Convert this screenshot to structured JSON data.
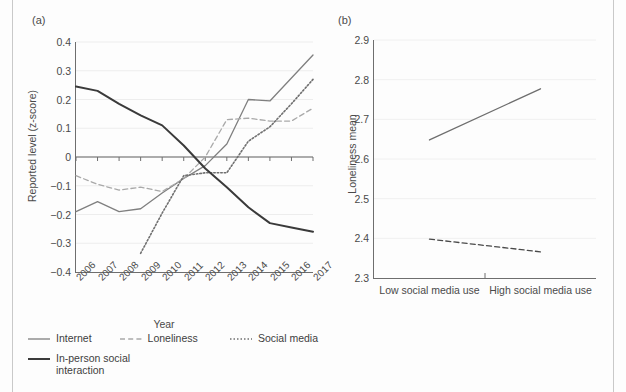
{
  "figure": {
    "background": "#fdfdfd",
    "rule_color": "#c9c9c9"
  },
  "panel_a": {
    "tag": "(a)",
    "xlabel": "Year",
    "ylabel": "Reported level (z-score)",
    "legend": [
      {
        "label": "Internet",
        "style": "solid",
        "color": "#7f7f7f"
      },
      {
        "label": "Loneliness",
        "style": "dashed",
        "color": "#a9a9a9"
      },
      {
        "label": "Social media",
        "style": "dotted",
        "color": "#707070"
      },
      {
        "label": "In-person social interaction",
        "style": "solid-bold",
        "color": "#3a3a3a"
      }
    ]
  },
  "panel_b": {
    "tag": "(b)",
    "ylabel": "Loneliness mean",
    "legend": [
      {
        "label": "Low in-person social interaction",
        "style": "solid",
        "color": "#6e6e6e"
      },
      {
        "label": "High in-person social interaction",
        "style": "dashed",
        "color": "#4a4a4a"
      }
    ]
  },
  "chart_data": [
    {
      "panel": "(a)",
      "type": "line",
      "title": "",
      "xlabel": "Year",
      "ylabel": "Reported level (z-score)",
      "x": [
        2006,
        2007,
        2008,
        2009,
        2010,
        2011,
        2012,
        2013,
        2014,
        2015,
        2016,
        2017
      ],
      "categories": [
        "2006",
        "2007",
        "2008",
        "2009",
        "2010",
        "2011",
        "2012",
        "2013",
        "2014",
        "2015",
        "2016",
        "2017"
      ],
      "xlim": [
        2006,
        2017
      ],
      "ylim": [
        -0.4,
        0.4
      ],
      "yticks": [
        -0.4,
        -0.3,
        -0.2,
        -0.1,
        0,
        0.1,
        0.2,
        0.3,
        0.4
      ],
      "ytick_labels": [
        "-0.4",
        "-0.3",
        "-0.2",
        "-0.1",
        "0",
        "0.1",
        "0.2",
        "0.3",
        "0.4"
      ],
      "grid": true,
      "legend_position": "bottom",
      "series": [
        {
          "name": "Internet",
          "style": "solid",
          "color": "#7f7f7f",
          "values": [
            -0.19,
            -0.155,
            -0.19,
            -0.18,
            -0.125,
            -0.075,
            -0.03,
            0.045,
            0.2,
            0.195,
            0.275,
            0.355
          ]
        },
        {
          "name": "Loneliness",
          "style": "dashed",
          "color": "#a9a9a9",
          "values": [
            -0.065,
            -0.095,
            -0.115,
            -0.105,
            -0.12,
            -0.075,
            0.0,
            0.13,
            0.135,
            0.125,
            0.125,
            0.17
          ]
        },
        {
          "name": "Social media",
          "style": "dotted",
          "color": "#707070",
          "values": [
            null,
            null,
            null,
            -0.335,
            -0.195,
            -0.065,
            -0.055,
            -0.055,
            0.055,
            0.105,
            0.185,
            0.27
          ]
        },
        {
          "name": "In-person social interaction",
          "style": "solid-bold",
          "color": "#3a3a3a",
          "values": [
            0.245,
            0.23,
            0.185,
            0.145,
            0.11,
            0.04,
            -0.04,
            -0.105,
            -0.175,
            -0.23,
            -0.245,
            -0.26
          ]
        }
      ]
    },
    {
      "panel": "(b)",
      "type": "line",
      "title": "",
      "xlabel": "",
      "ylabel": "Loneliness mean",
      "categories": [
        "Low social media use",
        "High social media use"
      ],
      "ylim": [
        2.3,
        2.9
      ],
      "yticks": [
        2.3,
        2.4,
        2.5,
        2.6,
        2.7,
        2.8,
        2.9
      ],
      "ytick_labels": [
        "2.3",
        "2.4",
        "2.5",
        "2.6",
        "2.7",
        "2.8",
        "2.9"
      ],
      "grid": true,
      "legend_position": "bottom",
      "series": [
        {
          "name": "Low in-person social interaction",
          "style": "solid",
          "color": "#6e6e6e",
          "values": [
            2.648,
            2.777
          ]
        },
        {
          "name": "High in-person social interaction",
          "style": "dashed",
          "color": "#4a4a4a",
          "values": [
            2.398,
            2.366
          ]
        }
      ]
    }
  ]
}
